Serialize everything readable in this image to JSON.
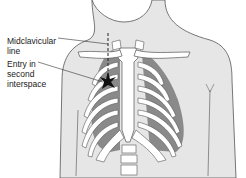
{
  "diagram": {
    "labels": {
      "midclavicular_line": "Midclavicular line",
      "entry_point": "Entry in second interspace"
    },
    "colors": {
      "skin": "#e6e6e6",
      "outline": "#555555",
      "bone": "#ffffff",
      "cartilage_shade": "#bdbdbd",
      "lung_dark": "#8a8a8a",
      "marker": "#111111"
    },
    "markers": [
      {
        "name": "entry-star",
        "label_ref": "entry_point"
      }
    ],
    "guides": [
      {
        "name": "midclavicular-dashed-line",
        "style": "dashed",
        "label_ref": "midclavicular_line"
      }
    ]
  }
}
